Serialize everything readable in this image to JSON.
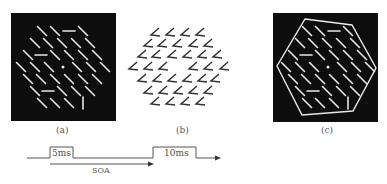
{
  "panels": [
    {
      "id": "a",
      "caption": "(a)",
      "background": "#0d0d0d",
      "stroke": "#e8e8e8",
      "rect": {
        "x": 11,
        "y": 13,
        "w": 105,
        "h": 108
      },
      "fixation": {
        "x": 63,
        "y": 67
      },
      "segments": [
        {
          "x": 42,
          "y": 31,
          "o": "diag"
        },
        {
          "x": 55,
          "y": 31,
          "o": "diag"
        },
        {
          "x": 69,
          "y": 31,
          "o": "horiz"
        },
        {
          "x": 83,
          "y": 31,
          "o": "diag"
        },
        {
          "x": 35,
          "y": 43,
          "o": "diag"
        },
        {
          "x": 48,
          "y": 43,
          "o": "diag"
        },
        {
          "x": 62,
          "y": 43,
          "o": "diag"
        },
        {
          "x": 76,
          "y": 43,
          "o": "diag"
        },
        {
          "x": 90,
          "y": 43,
          "o": "diag"
        },
        {
          "x": 28,
          "y": 55,
          "o": "diag"
        },
        {
          "x": 41,
          "y": 55,
          "o": "horiz"
        },
        {
          "x": 55,
          "y": 55,
          "o": "diag"
        },
        {
          "x": 69,
          "y": 55,
          "o": "diag"
        },
        {
          "x": 83,
          "y": 55,
          "o": "diag"
        },
        {
          "x": 97,
          "y": 55,
          "o": "diag"
        },
        {
          "x": 21,
          "y": 67,
          "o": "diag"
        },
        {
          "x": 35,
          "y": 67,
          "o": "diag"
        },
        {
          "x": 49,
          "y": 67,
          "o": "diag"
        },
        {
          "x": 77,
          "y": 67,
          "o": "diag"
        },
        {
          "x": 91,
          "y": 67,
          "o": "diag"
        },
        {
          "x": 105,
          "y": 67,
          "o": "diag"
        },
        {
          "x": 28,
          "y": 79,
          "o": "diag"
        },
        {
          "x": 41,
          "y": 79,
          "o": "diag"
        },
        {
          "x": 55,
          "y": 79,
          "o": "diag"
        },
        {
          "x": 69,
          "y": 79,
          "o": "diag"
        },
        {
          "x": 83,
          "y": 79,
          "o": "diag"
        },
        {
          "x": 97,
          "y": 79,
          "o": "diag"
        },
        {
          "x": 35,
          "y": 91,
          "o": "diag"
        },
        {
          "x": 48,
          "y": 91,
          "o": "horiz"
        },
        {
          "x": 62,
          "y": 91,
          "o": "diag"
        },
        {
          "x": 76,
          "y": 91,
          "o": "diag"
        },
        {
          "x": 90,
          "y": 91,
          "o": "diag"
        },
        {
          "x": 42,
          "y": 103,
          "o": "diag"
        },
        {
          "x": 55,
          "y": 103,
          "o": "diag"
        },
        {
          "x": 69,
          "y": 103,
          "o": "diag"
        },
        {
          "x": 83,
          "y": 103,
          "o": "vert"
        }
      ]
    },
    {
      "id": "b",
      "caption": "(b)",
      "background": "#ffffff",
      "stroke": "#333333",
      "shapes": [
        {
          "x": 155,
          "y": 33
        },
        {
          "x": 170,
          "y": 33
        },
        {
          "x": 185,
          "y": 33
        },
        {
          "x": 200,
          "y": 33
        },
        {
          "x": 148,
          "y": 44
        },
        {
          "x": 162,
          "y": 44
        },
        {
          "x": 177,
          "y": 44
        },
        {
          "x": 193,
          "y": 44
        },
        {
          "x": 208,
          "y": 44
        },
        {
          "x": 142,
          "y": 55
        },
        {
          "x": 156,
          "y": 55
        },
        {
          "x": 172,
          "y": 55
        },
        {
          "x": 187,
          "y": 55
        },
        {
          "x": 202,
          "y": 55
        },
        {
          "x": 217,
          "y": 55
        },
        {
          "x": 133,
          "y": 67
        },
        {
          "x": 148,
          "y": 67
        },
        {
          "x": 163,
          "y": 67
        },
        {
          "x": 193,
          "y": 67
        },
        {
          "x": 208,
          "y": 67
        },
        {
          "x": 224,
          "y": 67
        },
        {
          "x": 142,
          "y": 79
        },
        {
          "x": 157,
          "y": 79
        },
        {
          "x": 172,
          "y": 79
        },
        {
          "x": 187,
          "y": 79
        },
        {
          "x": 202,
          "y": 79
        },
        {
          "x": 215,
          "y": 79
        },
        {
          "x": 148,
          "y": 91
        },
        {
          "x": 163,
          "y": 91
        },
        {
          "x": 178,
          "y": 91
        },
        {
          "x": 193,
          "y": 91
        },
        {
          "x": 208,
          "y": 91
        },
        {
          "x": 155,
          "y": 102
        },
        {
          "x": 170,
          "y": 102
        },
        {
          "x": 185,
          "y": 102
        },
        {
          "x": 200,
          "y": 102
        }
      ]
    },
    {
      "id": "c",
      "caption": "(c)",
      "background": "#0d0d0d",
      "stroke": "#e8e8e8",
      "rect": {
        "x": 273,
        "y": 13,
        "w": 105,
        "h": 109
      },
      "hexagon": [
        [
          305,
          19
        ],
        [
          352,
          25
        ],
        [
          376,
          68
        ],
        [
          353,
          111
        ],
        [
          302,
          115
        ],
        [
          277,
          66
        ]
      ]
    }
  ],
  "timing": {
    "pulse1_label": "5ms",
    "pulse2_label": "10ms",
    "soa_label": "SOA",
    "color": "#555555"
  }
}
